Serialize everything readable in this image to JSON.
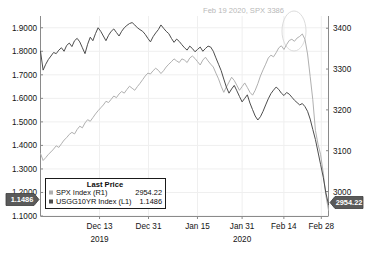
{
  "chart_data": {
    "type": "line",
    "title": "",
    "xlabel": "",
    "ylabel": "",
    "grid": true,
    "legend_position": "bottom-left",
    "annotations": [
      {
        "text": "Feb 19 2020, SPX 3386",
        "x": "2020-02-19",
        "value": 3386
      }
    ],
    "x_tick_labels": [
      "Dec 13",
      "Dec 31",
      "Jan 15",
      "Jan 31",
      "Feb 14",
      "Feb 28"
    ],
    "year_labels": [
      "2019",
      "2020"
    ],
    "left_axis": {
      "label": "USGG10YR Index (L1)",
      "ticks": [
        "1.1000",
        "1.2000",
        "1.3000",
        "1.4000",
        "1.5000",
        "1.6000",
        "1.7000",
        "1.8000",
        "1.9000"
      ],
      "ylim": [
        1.1,
        1.95
      ],
      "marker": "1.1486"
    },
    "right_axis": {
      "label": "SPX Index (R1)",
      "ticks": [
        "3000",
        "3100",
        "3200",
        "3300",
        "3400"
      ],
      "ylim": [
        2940,
        3430
      ],
      "marker": "2954.22"
    },
    "series": [
      {
        "name": "SPX Index (R1)",
        "axis": "right",
        "color": "#b0b0b0",
        "last_price": "2954.22",
        "values": [
          3093,
          3076,
          3083,
          3091,
          3097,
          3104,
          3112,
          3108,
          3117,
          3126,
          3132,
          3140,
          3145,
          3141,
          3152,
          3160,
          3156,
          3168,
          3176,
          3172,
          3181,
          3190,
          3198,
          3205,
          3212,
          3221,
          3218,
          3226,
          3234,
          3230,
          3239,
          3245,
          3241,
          3250,
          3258,
          3253,
          3248,
          3257,
          3265,
          3274,
          3283,
          3290,
          3288,
          3296,
          3302,
          3297,
          3289,
          3296,
          3305,
          3312,
          3318,
          3325,
          3320,
          3316,
          3325,
          3322,
          3316,
          3327,
          3332,
          3326,
          3318,
          3310,
          3322,
          3329,
          3320,
          3312,
          3305,
          3290,
          3276,
          3258,
          3243,
          3256,
          3268,
          3280,
          3272,
          3260,
          3248,
          3257,
          3266,
          3255,
          3243,
          3236,
          3248,
          3264,
          3283,
          3298,
          3312,
          3327,
          3334,
          3330,
          3340,
          3352,
          3357,
          3348,
          3360,
          3370,
          3373,
          3368,
          3376,
          3380,
          3386,
          3373,
          3337,
          3282,
          3225,
          3150,
          3116,
          3090,
          3045,
          2990,
          2954.22
        ]
      },
      {
        "name": "USGG10YR Index (L1)",
        "axis": "left",
        "color": "#4d4d4d",
        "last_price": "1.1486",
        "values": [
          1.8,
          1.72,
          1.745,
          1.765,
          1.78,
          1.795,
          1.79,
          1.805,
          1.815,
          1.8,
          1.825,
          1.835,
          1.82,
          1.845,
          1.855,
          1.84,
          1.815,
          1.79,
          1.83,
          1.86,
          1.845,
          1.875,
          1.9,
          1.885,
          1.865,
          1.845,
          1.868,
          1.885,
          1.895,
          1.88,
          1.865,
          1.885,
          1.9,
          1.91,
          1.918,
          1.922,
          1.912,
          1.9,
          1.892,
          1.885,
          1.872,
          1.855,
          1.84,
          1.862,
          1.878,
          1.892,
          1.912,
          1.898,
          1.885,
          1.875,
          1.855,
          1.838,
          1.852,
          1.842,
          1.828,
          1.815,
          1.805,
          1.822,
          1.812,
          1.798,
          1.808,
          1.818,
          1.8,
          1.812,
          1.822,
          1.818,
          1.8,
          1.772,
          1.745,
          1.718,
          1.682,
          1.648,
          1.622,
          1.64,
          1.655,
          1.632,
          1.608,
          1.585,
          1.6,
          1.615,
          1.58,
          1.552,
          1.525,
          1.508,
          1.522,
          1.545,
          1.572,
          1.598,
          1.62,
          1.635,
          1.648,
          1.638,
          1.622,
          1.612,
          1.625,
          1.618,
          1.605,
          1.592,
          1.582,
          1.572,
          1.578,
          1.565,
          1.545,
          1.512,
          1.468,
          1.425,
          1.372,
          1.318,
          1.265,
          1.198,
          1.1486
        ]
      }
    ]
  },
  "legend": {
    "title": "Last Price",
    "rows": [
      {
        "marker_color": "#b0b0b0",
        "name": "SPX Index (R1)",
        "value": "2954.22"
      },
      {
        "marker_color": "#4d4d4d",
        "name": "USGG10YR Index (L1)",
        "value": "1.1486"
      }
    ]
  },
  "annotation": {
    "text": "Feb 19 2020, SPX 3386"
  },
  "axis_markers": {
    "left": "1.1486",
    "right": "2954.22"
  },
  "axes": {
    "left_ticks": [
      "1.9000",
      "1.8000",
      "1.7000",
      "1.6000",
      "1.5000",
      "1.4000",
      "1.3000",
      "1.2000",
      "1.1000"
    ],
    "right_ticks": [
      "3400",
      "3300",
      "3200",
      "3100",
      "3000"
    ],
    "x_ticks": [
      "Dec 13",
      "Dec 31",
      "Jan 15",
      "Jan 31",
      "Feb 14",
      "Feb 28"
    ],
    "years": [
      "2019",
      "2020"
    ]
  },
  "colors": {
    "spx_line": "#b0b0b0",
    "ust_line": "#4d4d4d",
    "marker_box": "#5a5a5a",
    "grid": "#efefef",
    "axis": "#8a8a8a"
  }
}
